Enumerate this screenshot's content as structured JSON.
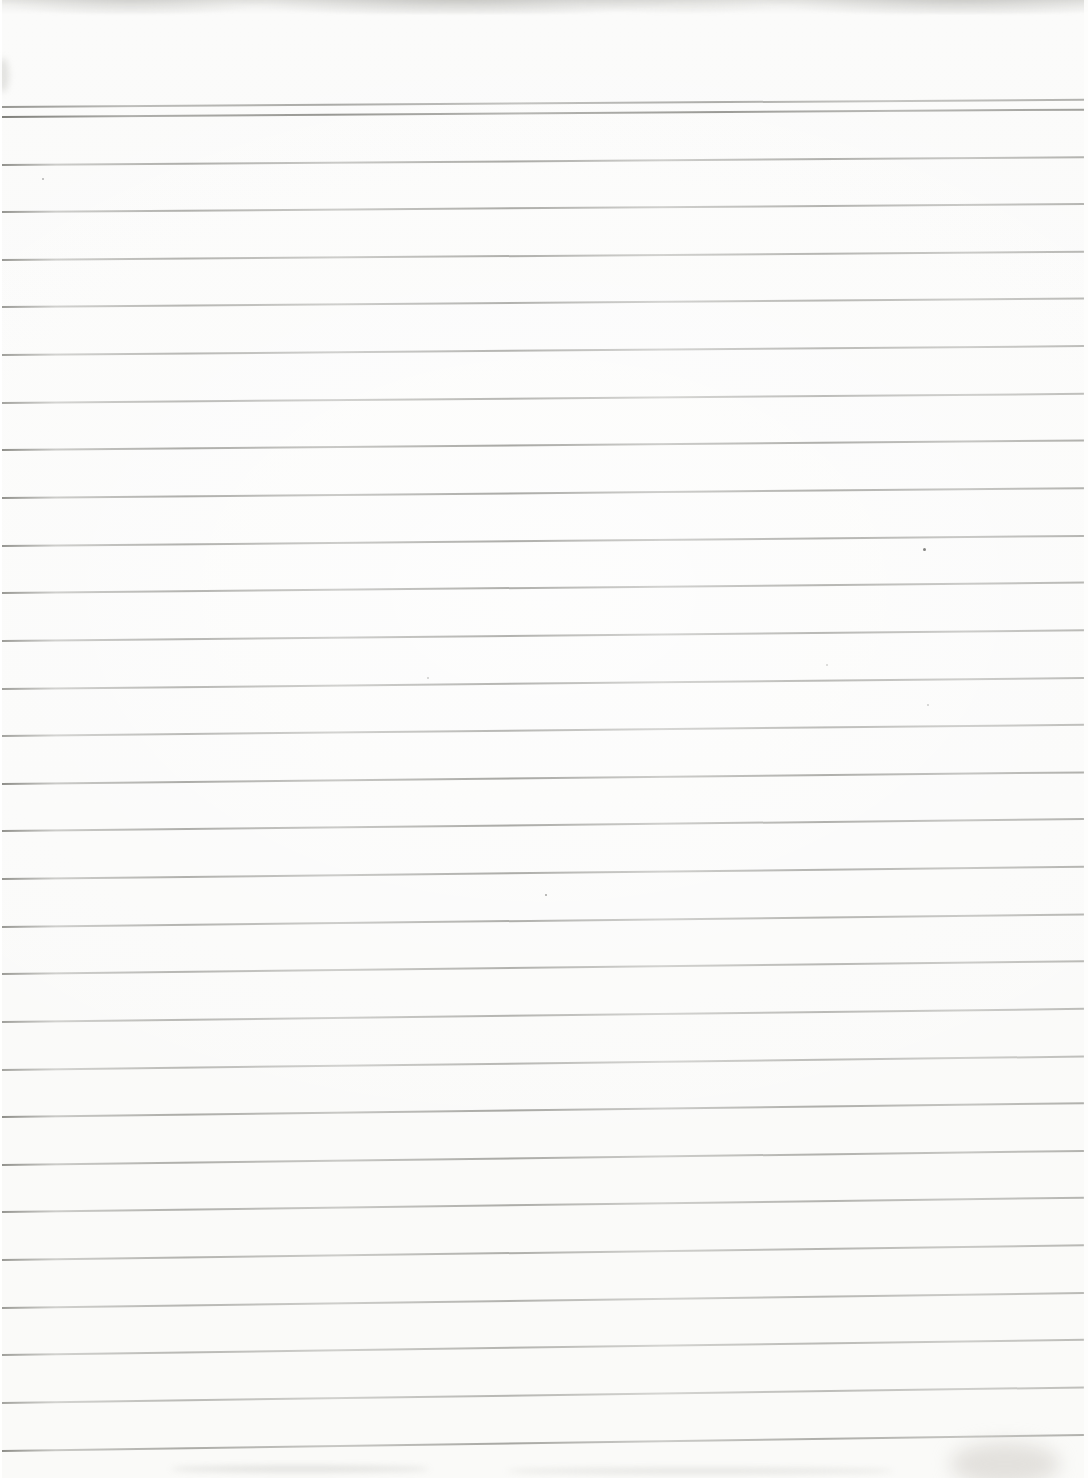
{
  "meta": {
    "page_text": ""
  },
  "page": {
    "width": 1088,
    "height": 1478,
    "paper_color": "#fbfbfa",
    "rule_color": "#767670",
    "header_rule_color": "#6c6c66"
  },
  "ruling": {
    "header_lines_y": [
      107,
      117
    ],
    "body_first_line_y": 164.6,
    "line_spacing": 47.63,
    "body_line_count": 28,
    "left_inset": 2,
    "right_inset": 4,
    "tilt_deg_top": -0.35,
    "tilt_deg_bottom": -0.85
  },
  "artifacts": {
    "top_edge_band": {
      "height": 14,
      "color": "#c8c8c4"
    },
    "specks": [
      {
        "x": 42,
        "y": 178,
        "size": 2,
        "opacity": 0.45
      },
      {
        "x": 923,
        "y": 548,
        "size": 3,
        "opacity": 0.75
      },
      {
        "x": 427,
        "y": 677,
        "size": 2,
        "opacity": 0.3
      },
      {
        "x": 826,
        "y": 664,
        "size": 2,
        "opacity": 0.25
      },
      {
        "x": 927,
        "y": 704,
        "size": 2,
        "opacity": 0.3
      },
      {
        "x": 545,
        "y": 894,
        "size": 2,
        "opacity": 0.55
      }
    ],
    "bottom_smudges": [
      {
        "x": 170,
        "y": 1466,
        "width": 260,
        "height": 6,
        "opacity": 0.4
      },
      {
        "x": 505,
        "y": 1468,
        "width": 390,
        "height": 6,
        "opacity": 0.32
      }
    ]
  }
}
